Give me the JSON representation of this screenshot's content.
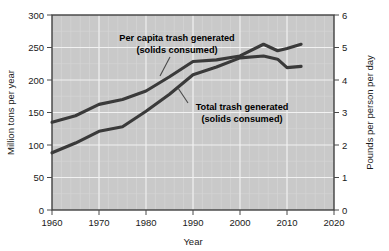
{
  "chart_data": {
    "type": "line",
    "title": "",
    "xlabel": "Year",
    "ylabel": "Million tons per year",
    "ylabel_right": "Pounds per person per day",
    "xlim": [
      1960,
      2020
    ],
    "ylim": [
      0,
      300
    ],
    "ylim_right": [
      0,
      6
    ],
    "xticks": [
      "1960",
      "1970",
      "1980",
      "1990",
      "2000",
      "2010",
      "2020"
    ],
    "xtick_values": [
      1960,
      1970,
      1980,
      1990,
      2000,
      2010,
      2020
    ],
    "yticks": [
      "0",
      "50",
      "100",
      "150",
      "200",
      "250",
      "300"
    ],
    "ytick_values": [
      0,
      50,
      100,
      150,
      200,
      250,
      300
    ],
    "yticks_right": [
      "0",
      "1",
      "2",
      "3",
      "4",
      "5",
      "6"
    ],
    "ytick_values_right": [
      0,
      1,
      2,
      3,
      4,
      5,
      6
    ],
    "grid": true,
    "legend_position": "inline-annotations",
    "line_color": "#3a3a3a",
    "plot_background": "#c9c9c9",
    "series": [
      {
        "name": "Per capita trash generated (solids consumed)",
        "axis": "right",
        "units": "Pounds per person per day",
        "x": [
          1960,
          1965,
          1970,
          1975,
          1980,
          1985,
          1990,
          1995,
          2000,
          2005,
          2008,
          2010,
          2013
        ],
        "values": [
          2.7,
          2.9,
          3.25,
          3.4,
          3.66,
          4.1,
          4.57,
          4.62,
          4.74,
          5.1,
          4.9,
          4.97,
          5.1
        ]
      },
      {
        "name": "Total trash generated (solids consumed)",
        "axis": "left",
        "units": "Million tons per year",
        "x": [
          1960,
          1965,
          1970,
          1975,
          1980,
          1985,
          1990,
          1995,
          2000,
          2005,
          2008,
          2010,
          2013
        ],
        "values": [
          88,
          103,
          121,
          128,
          152,
          178,
          208,
          220,
          234,
          237,
          232,
          219,
          221
        ]
      }
    ],
    "annotations": [
      {
        "id": "per-capita",
        "line1": "Per capita trash generated",
        "line2": "(solids consumed)"
      },
      {
        "id": "total-trash",
        "line1": "Total trash generated",
        "line2": "(solids consumed)"
      }
    ]
  }
}
